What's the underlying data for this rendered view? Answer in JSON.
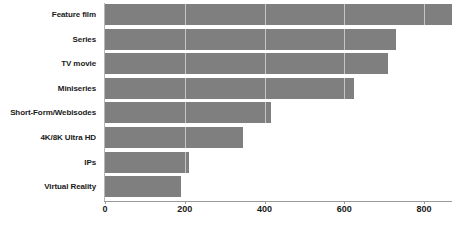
{
  "chart_data": {
    "type": "bar",
    "orientation": "horizontal",
    "title": "",
    "subtitle": "",
    "xlabel": "",
    "ylabel": "",
    "categories": [
      "Feature film",
      "Series",
      "TV movie",
      "Miniseries",
      "Short-Form/Webisodes",
      "4K/8K Ultra HD",
      "IPs",
      "Virtual Reality"
    ],
    "values": [
      870,
      730,
      710,
      625,
      415,
      345,
      210,
      190
    ],
    "xlim": [
      0,
      870
    ],
    "xticks": [
      0,
      200,
      400,
      600,
      800
    ],
    "xtick_labels": [
      "0",
      "200",
      "400",
      "600",
      "800"
    ],
    "grid": true,
    "grid_axis": "x",
    "legend": false,
    "bar_color": "#7f7f7f",
    "axis_color": "#9a9a9a",
    "text_color": "#1a1a1a",
    "background": "#ffffff"
  }
}
